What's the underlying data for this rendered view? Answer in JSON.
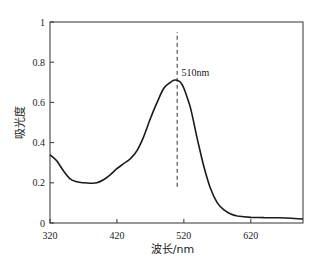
{
  "chart_data": {
    "type": "line",
    "title": "",
    "xlabel": "波长/nm",
    "ylabel": "吸光度",
    "xlim": [
      320,
      698
    ],
    "ylim": [
      0,
      1
    ],
    "grid": false,
    "legend": null,
    "x_ticks": [
      320,
      420,
      520,
      620
    ],
    "y_ticks": [
      0,
      0.2,
      0.4,
      0.6,
      0.8,
      1
    ],
    "y_tick_labels": [
      "0",
      "0.2",
      "0.4",
      "0.6",
      "0.8",
      "1"
    ],
    "series": [
      {
        "name": "absorbance",
        "x": [
          320,
          330,
          340,
          350,
          360,
          370,
          380,
          390,
          400,
          410,
          420,
          430,
          440,
          450,
          460,
          470,
          480,
          490,
          500,
          505,
          510,
          515,
          520,
          530,
          540,
          550,
          560,
          570,
          580,
          590,
          600,
          620,
          640,
          660,
          680,
          698
        ],
        "y": [
          0.34,
          0.31,
          0.26,
          0.22,
          0.205,
          0.2,
          0.198,
          0.2,
          0.215,
          0.24,
          0.27,
          0.295,
          0.32,
          0.36,
          0.43,
          0.52,
          0.6,
          0.67,
          0.7,
          0.71,
          0.71,
          0.7,
          0.67,
          0.57,
          0.42,
          0.28,
          0.17,
          0.1,
          0.065,
          0.045,
          0.035,
          0.028,
          0.027,
          0.026,
          0.024,
          0.02
        ]
      }
    ],
    "annotations": [
      {
        "type": "vline",
        "x": 510,
        "style": "dashed",
        "y_from": 0.18,
        "y_to": 0.95
      },
      {
        "type": "text",
        "text": "510nm",
        "x": 512,
        "y": 0.73
      }
    ]
  }
}
